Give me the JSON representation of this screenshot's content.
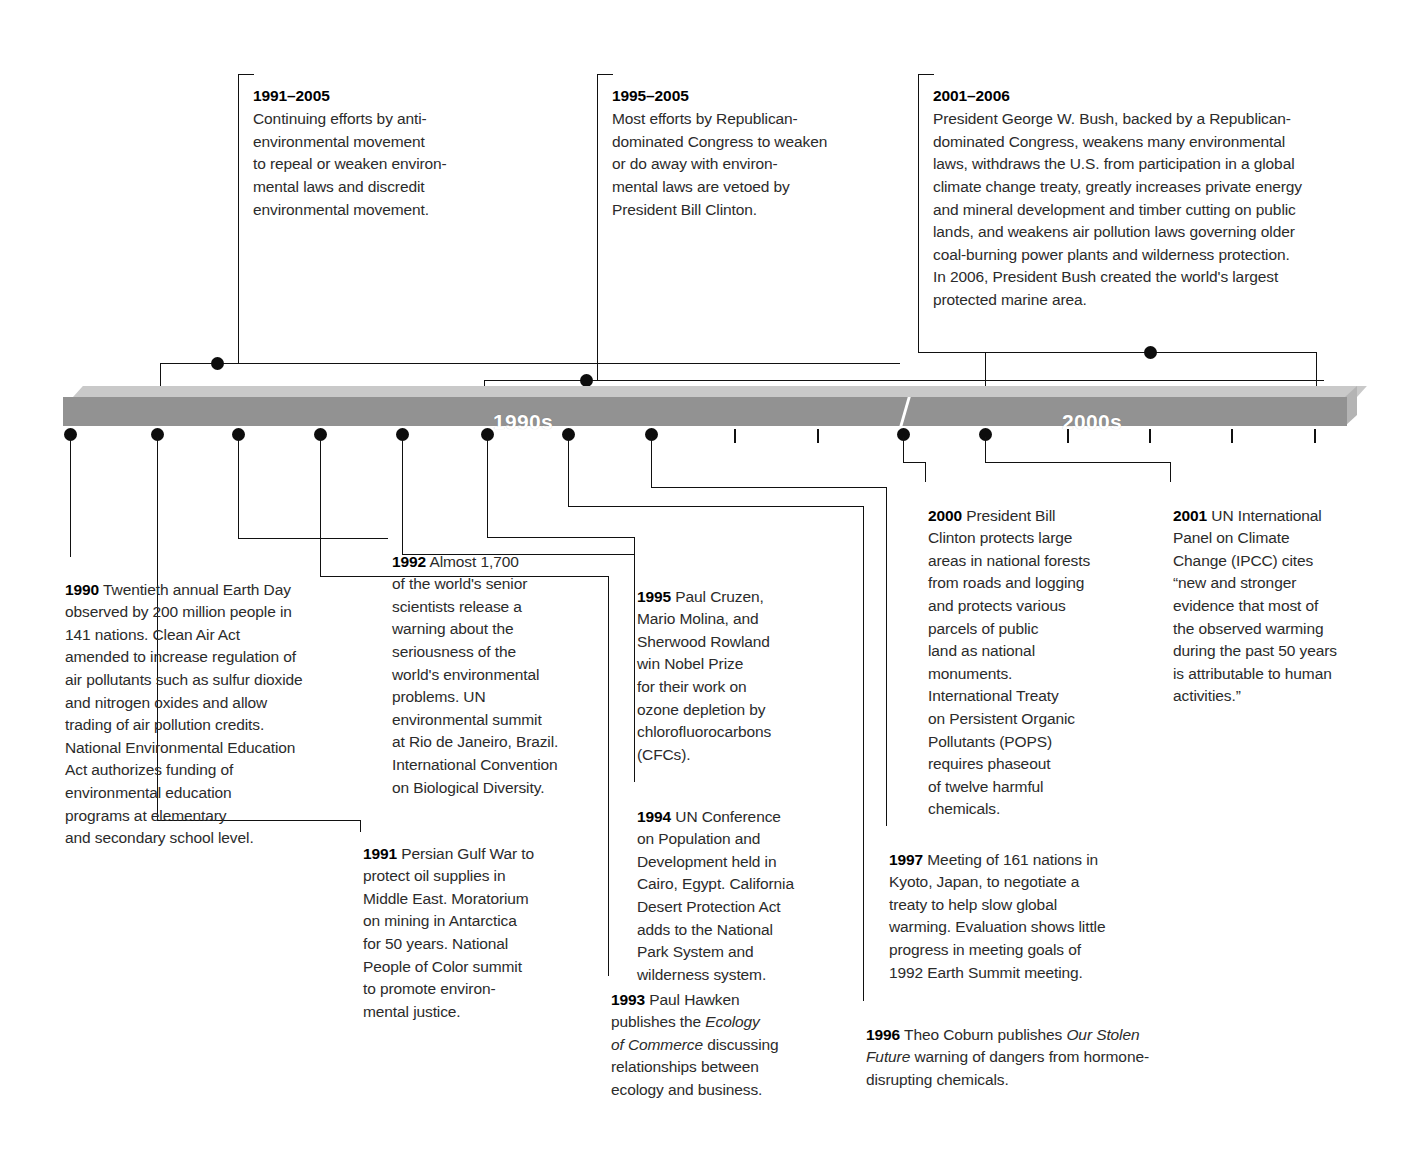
{
  "diagram": {
    "decades": [
      {
        "label": "1990s"
      },
      {
        "label": "2000s"
      }
    ],
    "accent_color": "#929292",
    "bar_top_color": "#c9c9c9",
    "text_color": "#2b2b2b"
  },
  "top_notes": [
    {
      "id": "note-1991-2005",
      "years": "1991–2005",
      "text": "Continuing efforts by anti-\nenvironmental movement\nto repeal or weaken environ-\nmental laws and discredit\nenvironmental movement."
    },
    {
      "id": "note-1995-2005",
      "years": "1995–2005",
      "text": "Most efforts by Republican-\ndominated Congress to weaken\nor do away with environ-\nmental laws are vetoed by\nPresident Bill Clinton."
    },
    {
      "id": "note-2001-2006",
      "years": "2001–2006",
      "text": "President George W. Bush, backed by a Republican-\ndominated Congress, weakens many environmental\nlaws, withdraws the U.S. from participation in a global\nclimate change treaty, greatly increases private energy\nand mineral development and timber cutting on public\nlands, and weakens air pollution laws governing older\ncoal-burning power plants and wilderness protection.\nIn 2006, President Bush created the world's largest\nprotected marine area."
    }
  ],
  "bottom_notes": {
    "y1990": {
      "year": "1990",
      "text": " Twentieth annual Earth Day\nobserved by 200 million people in\n141 nations. Clean Air Act\namended to increase regulation of\nair pollutants such as sulfur dioxide\nand nitrogen oxides and allow\ntrading of air pollution credits.\nNational Environmental Education\nAct authorizes funding of\nenvironmental education\nprograms at elementary\nand secondary school level."
    },
    "y1991": {
      "year": "1991",
      "text": " Persian Gulf War to\nprotect oil supplies in\nMiddle East. Moratorium\non mining in Antarctica\nfor 50 years. National\nPeople of Color summit\nto promote environ-\nmental justice."
    },
    "y1992": {
      "year": "1992",
      "text": " Almost 1,700\nof the world's senior\nscientists release a\nwarning about the\nseriousness of the\nworld's environmental\nproblems. UN\nenvironmental summit\nat Rio de Janeiro, Brazil.\nInternational Convention\non Biological Diversity."
    },
    "y1993": {
      "year": "1993",
      "pre": " Paul Hawken\npublishes the ",
      "italic": "Ecology\nof Commerce",
      "post": " discussing\nrelationships between\necology and business."
    },
    "y1994": {
      "year": "1994",
      "text": " UN Conference\non  Population and\nDevelopment held in\nCairo, Egypt. California\nDesert Protection Act\nadds to the National\nPark System and\nwilderness system."
    },
    "y1995": {
      "year": "1995",
      "text": " Paul Cruzen,\nMario Molina, and\nSherwood Rowland\nwin Nobel Prize\nfor their work on\nozone depletion by\nchlorofluorocarbons\n(CFCs)."
    },
    "y1996": {
      "year": "1996",
      "pre": " Theo Coburn publishes ",
      "italic": "Our Stolen\nFuture",
      "post": " warning of dangers from hormone-\ndisrupting chemicals."
    },
    "y1997": {
      "year": "1997",
      "text": " Meeting of 161 nations in\nKyoto, Japan, to negotiate a\ntreaty to help slow global\nwarming. Evaluation shows little\nprogress in meeting goals of\n1992 Earth Summit meeting."
    },
    "y2000": {
      "year": "2000",
      "text": " President Bill\nClinton protects large\nareas in national forests\nfrom roads and logging\nand protects various\nparcels of public\nland as national\nmonuments.\nInternational Treaty\non Persistent Organic\nPollutants (POPS)\nrequires phaseout\nof twelve harmful\nchemicals."
    },
    "y2001": {
      "year": "2001",
      "text": " UN International\nPanel on Climate\nChange (IPCC) cites\n“new and stronger\nevidence that most of\nthe observed warming\nduring the past 50 years\nis attributable to human\nactivities.”"
    }
  }
}
